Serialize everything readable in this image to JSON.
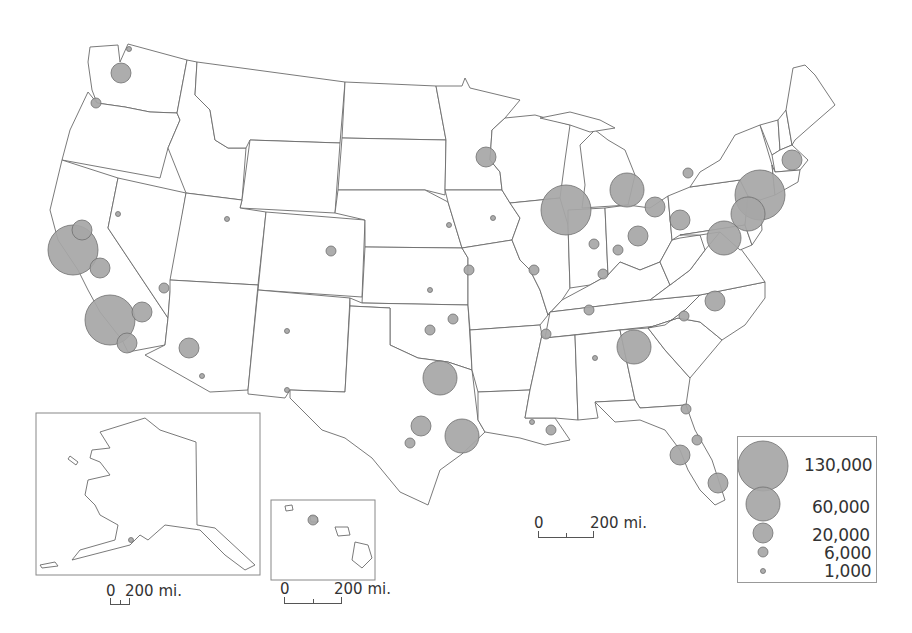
{
  "map": {
    "type": "proportional-symbol",
    "bubble_color": "#a6a6a6",
    "bubble_stroke": "#6e6e6e",
    "border_color": "#6b6b6b"
  },
  "legend": {
    "items": [
      {
        "label": "130,000",
        "value": 130000,
        "radius": 25
      },
      {
        "label": "60,000",
        "value": 60000,
        "radius": 17
      },
      {
        "label": "20,000",
        "value": 20000,
        "radius": 10
      },
      {
        "label": "6,000",
        "value": 6000,
        "radius": 5
      },
      {
        "label": "1,000",
        "value": 1000,
        "radius": 2.5
      }
    ]
  },
  "scale_bars": {
    "conus": {
      "zero": "0",
      "label": "200 mi."
    },
    "alaska": {
      "zero": "0",
      "label": "200 mi."
    },
    "hawaii": {
      "zero": "0",
      "label": "200 mi."
    }
  },
  "insets": [
    "Alaska",
    "Hawaii"
  ],
  "chart_data": {
    "type": "scatter",
    "title": "",
    "subtitle": "Proportional symbol map of U.S. cities (contiguous US with Alaska and Hawaii insets)",
    "legend_values": [
      130000,
      60000,
      20000,
      6000,
      1000
    ],
    "legend_labels": [
      "130,000",
      "60,000",
      "20,000",
      "6,000",
      "1,000"
    ],
    "bubbles": [
      {
        "region": "Seattle WA",
        "x": 121,
        "y": 73,
        "value": 20000
      },
      {
        "region": "Bellingham WA",
        "x": 129,
        "y": 49,
        "value": 1000
      },
      {
        "region": "Portland OR",
        "x": 96,
        "y": 103,
        "value": 6000
      },
      {
        "region": "SF Bay Area CA",
        "x": 73,
        "y": 250,
        "value": 130000
      },
      {
        "region": "Sacramento CA",
        "x": 82,
        "y": 230,
        "value": 20000
      },
      {
        "region": "Fresno CA",
        "x": 100,
        "y": 268,
        "value": 20000
      },
      {
        "region": "Los Angeles CA",
        "x": 110,
        "y": 320,
        "value": 130000
      },
      {
        "region": "Riverside CA",
        "x": 142,
        "y": 312,
        "value": 20000
      },
      {
        "region": "San Diego CA",
        "x": 127,
        "y": 343,
        "value": 20000
      },
      {
        "region": "Las Vegas NV",
        "x": 164,
        "y": 288,
        "value": 6000
      },
      {
        "region": "Reno NV",
        "x": 118,
        "y": 214,
        "value": 1000
      },
      {
        "region": "Phoenix AZ",
        "x": 189,
        "y": 348,
        "value": 20000
      },
      {
        "region": "Tucson AZ",
        "x": 202,
        "y": 376,
        "value": 1000
      },
      {
        "region": "Salt Lake City UT",
        "x": 227,
        "y": 219,
        "value": 1000
      },
      {
        "region": "Denver CO",
        "x": 331,
        "y": 251,
        "value": 6000
      },
      {
        "region": "Albuquerque NM",
        "x": 287,
        "y": 331,
        "value": 1000
      },
      {
        "region": "El Paso TX",
        "x": 287,
        "y": 390,
        "value": 1000
      },
      {
        "region": "Dallas-Fort Worth TX",
        "x": 440,
        "y": 378,
        "value": 60000
      },
      {
        "region": "Houston TX",
        "x": 462,
        "y": 436,
        "value": 60000
      },
      {
        "region": "Austin TX",
        "x": 421,
        "y": 426,
        "value": 20000
      },
      {
        "region": "San Antonio TX",
        "x": 410,
        "y": 443,
        "value": 6000
      },
      {
        "region": "Oklahoma City OK",
        "x": 430,
        "y": 330,
        "value": 6000
      },
      {
        "region": "Tulsa OK",
        "x": 453,
        "y": 319,
        "value": 6000
      },
      {
        "region": "Wichita KS",
        "x": 430,
        "y": 290,
        "value": 1000
      },
      {
        "region": "Kansas City MO",
        "x": 469,
        "y": 270,
        "value": 6000
      },
      {
        "region": "Omaha NE",
        "x": 449,
        "y": 225,
        "value": 1000
      },
      {
        "region": "Minneapolis MN",
        "x": 486,
        "y": 157,
        "value": 20000
      },
      {
        "region": "Des Moines IA",
        "x": 493,
        "y": 218,
        "value": 1000
      },
      {
        "region": "Chicago IL",
        "x": 566,
        "y": 210,
        "value": 130000
      },
      {
        "region": "St. Louis MO",
        "x": 534,
        "y": 270,
        "value": 6000
      },
      {
        "region": "Detroit MI",
        "x": 627,
        "y": 190,
        "value": 60000
      },
      {
        "region": "Cleveland OH",
        "x": 655,
        "y": 207,
        "value": 20000
      },
      {
        "region": "Columbus OH",
        "x": 638,
        "y": 236,
        "value": 20000
      },
      {
        "region": "Pittsburgh PA",
        "x": 680,
        "y": 220,
        "value": 20000
      },
      {
        "region": "Indianapolis IN",
        "x": 594,
        "y": 244,
        "value": 6000
      },
      {
        "region": "Cincinnati OH",
        "x": 618,
        "y": 250,
        "value": 6000
      },
      {
        "region": "Louisville KY",
        "x": 603,
        "y": 274,
        "value": 6000
      },
      {
        "region": "Nashville TN",
        "x": 589,
        "y": 310,
        "value": 6000
      },
      {
        "region": "Memphis TN",
        "x": 546,
        "y": 334,
        "value": 6000
      },
      {
        "region": "Atlanta GA",
        "x": 634,
        "y": 347,
        "value": 60000
      },
      {
        "region": "Charlotte NC",
        "x": 684,
        "y": 316,
        "value": 6000
      },
      {
        "region": "Raleigh NC",
        "x": 715,
        "y": 301,
        "value": 20000
      },
      {
        "region": "Washington DC",
        "x": 724,
        "y": 238,
        "value": 60000
      },
      {
        "region": "New York NY",
        "x": 760,
        "y": 195,
        "value": 130000
      },
      {
        "region": "Philadelphia PA",
        "x": 748,
        "y": 214,
        "value": 60000
      },
      {
        "region": "Boston MA",
        "x": 792,
        "y": 160,
        "value": 20000
      },
      {
        "region": "Buffalo NY",
        "x": 688,
        "y": 173,
        "value": 6000
      },
      {
        "region": "New Orleans LA",
        "x": 551,
        "y": 430,
        "value": 6000
      },
      {
        "region": "Baton Rouge LA",
        "x": 532,
        "y": 422,
        "value": 1000
      },
      {
        "region": "Jacksonville FL",
        "x": 686,
        "y": 409,
        "value": 6000
      },
      {
        "region": "Tampa FL",
        "x": 680,
        "y": 455,
        "value": 20000
      },
      {
        "region": "Orlando FL",
        "x": 697,
        "y": 440,
        "value": 6000
      },
      {
        "region": "Miami FL",
        "x": 718,
        "y": 483,
        "value": 20000
      },
      {
        "region": "Birmingham AL",
        "x": 595,
        "y": 358,
        "value": 1000
      },
      {
        "region": "Honolulu HI",
        "x": 313,
        "y": 520,
        "value": 6000
      },
      {
        "region": "Anchorage AK",
        "x": 131,
        "y": 540,
        "value": 1000
      }
    ]
  }
}
